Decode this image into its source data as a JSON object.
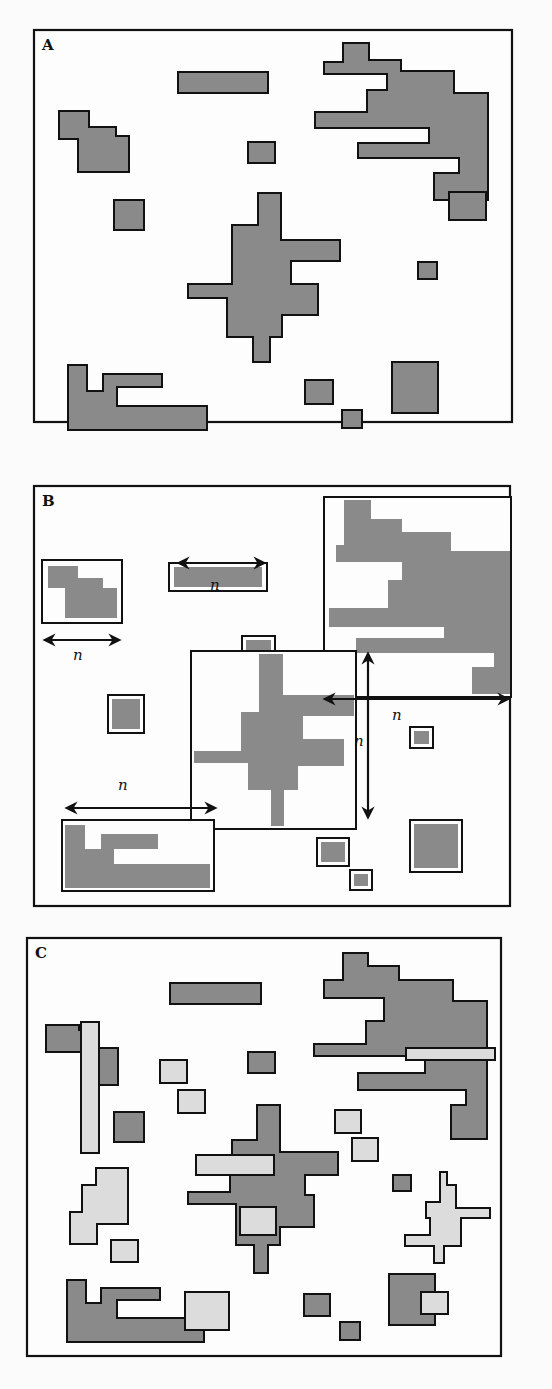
{
  "figure": {
    "colors": {
      "background": "#fdfdfd",
      "patch_dark": "#8a8a8a",
      "patch_light": "#dcdcdc",
      "outline": "#111111"
    },
    "panels": [
      {
        "id": "A",
        "label": "A",
        "frame": [
          34,
          30,
          478,
          392
        ],
        "dark_patches": [
          {
            "type": "polygon",
            "points": "343,43 369,43 369,60 401,60 401,71 454,71 454,93 488,93 488,200 434,200 434,173 459,173 459,158 358,158 358,143 429,143 429,128 315,128 315,112 367,112 367,90 387,90 387,74 324,74 324,62 343,62"
          },
          {
            "type": "polygon",
            "points": "59,111 89,111 89,127 116,127 116,136 129,136 129,172 78,172 78,139 59,139"
          },
          {
            "type": "rect",
            "x": 178,
            "y": 72,
            "w": 90,
            "h": 21
          },
          {
            "type": "rect",
            "x": 248,
            "y": 142,
            "w": 27,
            "h": 21
          },
          {
            "type": "rect",
            "x": 114,
            "y": 200,
            "w": 30,
            "h": 30
          },
          {
            "type": "polygon",
            "points": "258,193 281,193 281,240 340,240 340,261 291,261 291,284 318,284 318,315 282,315 282,337 270,337 270,362 253,362 253,337 227,337 227,298 188,298 188,284 232,284 232,225 258,225"
          },
          {
            "type": "rect",
            "x": 418,
            "y": 262,
            "w": 19,
            "h": 17
          },
          {
            "type": "rect",
            "x": 449,
            "y": 192,
            "w": 37,
            "h": 28
          },
          {
            "type": "polygon",
            "points": "68,365 87,365 87,391 103,391 103,374 162,374 162,387 117,387 117,406 207,406 207,430 68,430"
          },
          {
            "type": "rect",
            "x": 305,
            "y": 380,
            "w": 28,
            "h": 24
          },
          {
            "type": "rect",
            "x": 342,
            "y": 410,
            "w": 20,
            "h": 18
          },
          {
            "type": "rect",
            "x": 392,
            "y": 362,
            "w": 46,
            "h": 51
          }
        ]
      },
      {
        "id": "B",
        "label": "B",
        "frame": [
          34,
          486,
          476,
          420
        ],
        "windows": [
          {
            "x": 42,
            "y": 560,
            "w": 80,
            "h": 63,
            "fill_polygons": [
              "48,566 78,566 78,578 103,578 103,588 117,588 117,618 65,618 65,588 48,588"
            ]
          },
          {
            "x": 169,
            "y": 563,
            "w": 98,
            "h": 28,
            "inner": {
              "x": 174,
              "y": 567,
              "w": 88,
              "h": 20
            }
          },
          {
            "x": 242,
            "y": 636,
            "w": 33,
            "h": 29,
            "inner": {
              "x": 246,
              "y": 640,
              "w": 25,
              "h": 21
            }
          },
          {
            "x": 108,
            "y": 695,
            "w": 36,
            "h": 38,
            "inner": {
              "x": 112,
              "y": 699,
              "w": 28,
              "h": 30
            }
          },
          {
            "x": 324,
            "y": 497,
            "w": 187,
            "h": 200,
            "fill_polygons": [
              "344,500 371,500 371,519 402,519 402,532 451,532 451,551 510,551 510,694 472,694 472,667 494,667 494,653 356,653 356,638 444,638 444,627 329,627 329,608 388,608 388,580 402,580 402,562 336,562 336,545 344,545"
            ]
          },
          {
            "x": 191,
            "y": 651,
            "w": 165,
            "h": 178,
            "fill_polygons": [
              "259,654 283,654 283,695 354,695 354,716 303,716 303,739 344,739 344,766 298,766 298,790 284,790 284,826 271,826 271,790 248,790 248,763 194,763 194,751 241,751 241,712 259,712"
            ]
          },
          {
            "x": 62,
            "y": 820,
            "w": 152,
            "h": 71,
            "fill_polygons": [
              "65,825 85,825 85,849 101,849 101,834 158,834 158,849 114,849 114,864 210,864 210,888 65,888"
            ]
          },
          {
            "x": 410,
            "y": 820,
            "w": 52,
            "h": 52,
            "inner": {
              "x": 414,
              "y": 824,
              "w": 44,
              "h": 44
            }
          },
          {
            "x": 317,
            "y": 838,
            "w": 32,
            "h": 28,
            "inner": {
              "x": 321,
              "y": 842,
              "w": 24,
              "h": 20
            }
          },
          {
            "x": 350,
            "y": 870,
            "w": 22,
            "h": 20,
            "inner": {
              "x": 354,
              "y": 874,
              "w": 14,
              "h": 12
            }
          },
          {
            "x": 410,
            "y": 727,
            "w": 23,
            "h": 21,
            "inner": {
              "x": 414,
              "y": 731,
              "w": 15,
              "h": 13
            }
          }
        ],
        "arrows": [
          {
            "orientation": "h",
            "x1": 176,
            "x2": 267,
            "y": 563,
            "label": "n",
            "label_x": 210,
            "label_y": 590
          },
          {
            "orientation": "h",
            "x1": 42,
            "x2": 122,
            "y": 640,
            "label": "n",
            "label_x": 73,
            "label_y": 660
          },
          {
            "orientation": "h",
            "x1": 322,
            "x2": 511,
            "y": 699,
            "label": "n",
            "label_x": 392,
            "label_y": 720
          },
          {
            "orientation": "v",
            "y1": 651,
            "y2": 820,
            "x": 368,
            "label": "n",
            "label_x": 354,
            "label_y": 746
          },
          {
            "orientation": "h",
            "x1": 64,
            "x2": 218,
            "y": 808,
            "label": "n",
            "label_x": 118,
            "label_y": 790
          }
        ]
      },
      {
        "id": "C",
        "label": "C",
        "frame": [
          27,
          938,
          474,
          418
        ],
        "dark_patches": [
          {
            "type": "polygon",
            "points": "343,953 368,953 368,966 399,966 399,980 453,980 453,1001 487,1001 487,1139 451,1139 451,1105 466,1105 466,1090 358,1090 358,1073 425,1073 425,1056 314,1056 314,1044 366,1044 366,1021 384,1021 384,998 324,998 324,980 343,980"
          },
          {
            "type": "polygon",
            "points": "46,1025 79,1025 79,1030 98,1030 98,1048 118,1048 118,1085 82,1085 82,1052 46,1052"
          },
          {
            "type": "rect",
            "x": 170,
            "y": 983,
            "w": 91,
            "h": 21
          },
          {
            "type": "rect",
            "x": 248,
            "y": 1052,
            "w": 27,
            "h": 21
          },
          {
            "type": "rect",
            "x": 114,
            "y": 1112,
            "w": 30,
            "h": 30
          },
          {
            "type": "polygon",
            "points": "257,1105 280,1105 280,1152 338,1152 338,1175 305,1175 305,1195 314,1195 314,1227 280,1227 280,1245 268,1245 268,1273 254,1273 254,1245 236,1245 236,1204 188,1204 188,1192 230,1192 230,1170 232,1170 232,1140 257,1140"
          },
          {
            "type": "rect",
            "x": 393,
            "y": 1175,
            "w": 18,
            "h": 16
          },
          {
            "type": "rect",
            "x": 389,
            "y": 1274,
            "w": 46,
            "h": 51
          },
          {
            "type": "polygon",
            "points": "67,1280 86,1280 86,1303 101,1303 101,1288 160,1288 160,1300 117,1300 117,1318 204,1318 204,1342 67,1342"
          },
          {
            "type": "rect",
            "x": 304,
            "y": 1294,
            "w": 26,
            "h": 22
          },
          {
            "type": "rect",
            "x": 340,
            "y": 1322,
            "w": 20,
            "h": 18
          }
        ],
        "light_patches": [
          {
            "type": "rect",
            "x": 81,
            "y": 1022,
            "w": 18,
            "h": 131
          },
          {
            "type": "rect",
            "x": 406,
            "y": 1048,
            "w": 89,
            "h": 12
          },
          {
            "type": "rect",
            "x": 160,
            "y": 1060,
            "w": 27,
            "h": 23
          },
          {
            "type": "rect",
            "x": 178,
            "y": 1090,
            "w": 27,
            "h": 23
          },
          {
            "type": "rect",
            "x": 335,
            "y": 1110,
            "w": 26,
            "h": 23
          },
          {
            "type": "rect",
            "x": 352,
            "y": 1138,
            "w": 26,
            "h": 23
          },
          {
            "type": "polygon",
            "points": "96,1168 128,1168 128,1224 97,1224 97,1244 70,1244 70,1212 82,1212 82,1185 96,1185"
          },
          {
            "type": "rect",
            "x": 111,
            "y": 1240,
            "w": 27,
            "h": 22
          },
          {
            "type": "rect",
            "x": 196,
            "y": 1155,
            "w": 78,
            "h": 20
          },
          {
            "type": "rect",
            "x": 240,
            "y": 1207,
            "w": 36,
            "h": 28
          },
          {
            "type": "polygon",
            "points": "440,1172 447,1172 447,1185 456,1185 456,1208 490,1208 490,1218 461,1218 461,1246 444,1246 444,1263 434,1263 434,1246 405,1246 405,1235 430,1235 430,1218 426,1218 426,1202 440,1202"
          },
          {
            "type": "rect",
            "x": 185,
            "y": 1292,
            "w": 44,
            "h": 38
          },
          {
            "type": "rect",
            "x": 421,
            "y": 1292,
            "w": 27,
            "h": 22
          }
        ]
      }
    ]
  }
}
